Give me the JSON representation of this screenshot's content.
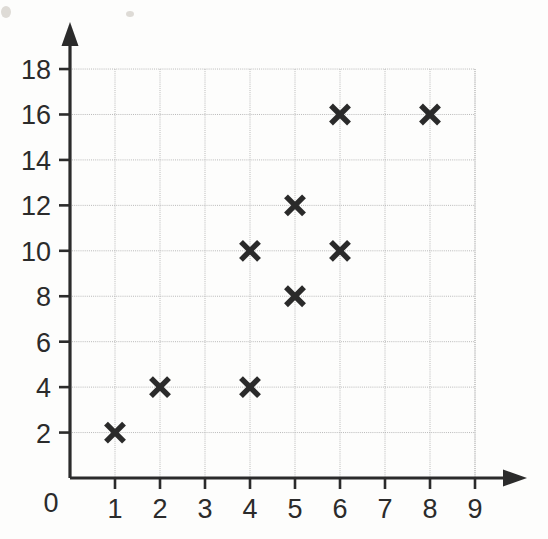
{
  "chart_data": {
    "type": "scatter",
    "title": "",
    "xlabel": "",
    "ylabel": "",
    "xlim": [
      0,
      9
    ],
    "ylim": [
      0,
      18
    ],
    "grid": true,
    "legend": "none",
    "marker": "x",
    "origin_label": "0",
    "x_ticks": [
      "1",
      "2",
      "3",
      "4",
      "5",
      "6",
      "7",
      "8",
      "9"
    ],
    "x_tick_values": [
      1,
      2,
      3,
      4,
      5,
      6,
      7,
      8,
      9
    ],
    "y_ticks": [
      "2",
      "4",
      "6",
      "8",
      "10",
      "12",
      "14",
      "16",
      "18"
    ],
    "y_tick_values": [
      2,
      4,
      6,
      8,
      10,
      12,
      14,
      16,
      18
    ],
    "x_gridline_values": [
      1,
      2,
      3,
      4,
      5,
      6,
      7,
      8,
      9
    ],
    "y_gridline_values": [
      2,
      4,
      6,
      8,
      10,
      12,
      14,
      16,
      18
    ],
    "points": [
      {
        "x": 1,
        "y": 2
      },
      {
        "x": 2,
        "y": 4
      },
      {
        "x": 4,
        "y": 4
      },
      {
        "x": 4,
        "y": 10
      },
      {
        "x": 5,
        "y": 8
      },
      {
        "x": 5,
        "y": 12
      },
      {
        "x": 6,
        "y": 10
      },
      {
        "x": 6,
        "y": 16
      },
      {
        "x": 8,
        "y": 16
      }
    ],
    "x_values": [
      1,
      2,
      4,
      4,
      5,
      5,
      6,
      6,
      8
    ],
    "y_values": [
      2,
      4,
      4,
      10,
      8,
      12,
      10,
      16,
      16
    ],
    "point_count": 9
  },
  "style": {
    "background_color": "#fdfdfc",
    "axis_color": "#2b2b2b",
    "grid_color": "#b9b9b9",
    "marker_color": "#2a2a2a",
    "label_color": "#2b2b2b"
  },
  "geometry": {
    "origin_x": 70,
    "origin_y": 478,
    "x_unit_px": 45,
    "y_unit_px": 22.72,
    "y_axis_arrow_tip_y": 22,
    "x_axis_arrow_tip_x": 527
  }
}
